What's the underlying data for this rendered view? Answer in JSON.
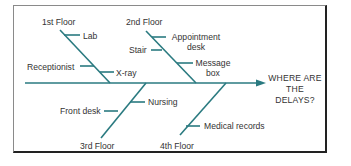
{
  "diagram": {
    "type": "fishbone",
    "effect": {
      "line1": "WHERE ARE",
      "line2": "THE DELAYS?"
    },
    "colors": {
      "bone": "#2a7a80",
      "text": "#333333",
      "frame": "#222222"
    },
    "categories": [
      {
        "name": "1st Floor",
        "causes": [
          "Lab",
          "Receptionist",
          "X-ray"
        ]
      },
      {
        "name": "2nd Floor",
        "causes": [
          "Appointment desk",
          "Stair",
          "Message box"
        ]
      },
      {
        "name": "3rd Floor",
        "causes": [
          "Nursing",
          "Front desk"
        ]
      },
      {
        "name": "4th Floor",
        "causes": [
          "Medical records"
        ]
      }
    ],
    "labels": {
      "floor1": "1st Floor",
      "floor2": "2nd Floor",
      "floor3": "3rd Floor",
      "floor4": "4th Floor",
      "lab": "Lab",
      "receptionist": "Receptionist",
      "xray": "X-ray",
      "appointment_l1": "Appointment",
      "appointment_l2": "desk",
      "stair": "Stair",
      "message_l1": "Message",
      "message_l2": "box",
      "nursing": "Nursing",
      "front_desk": "Front desk",
      "medical_records": "Medical records"
    }
  }
}
